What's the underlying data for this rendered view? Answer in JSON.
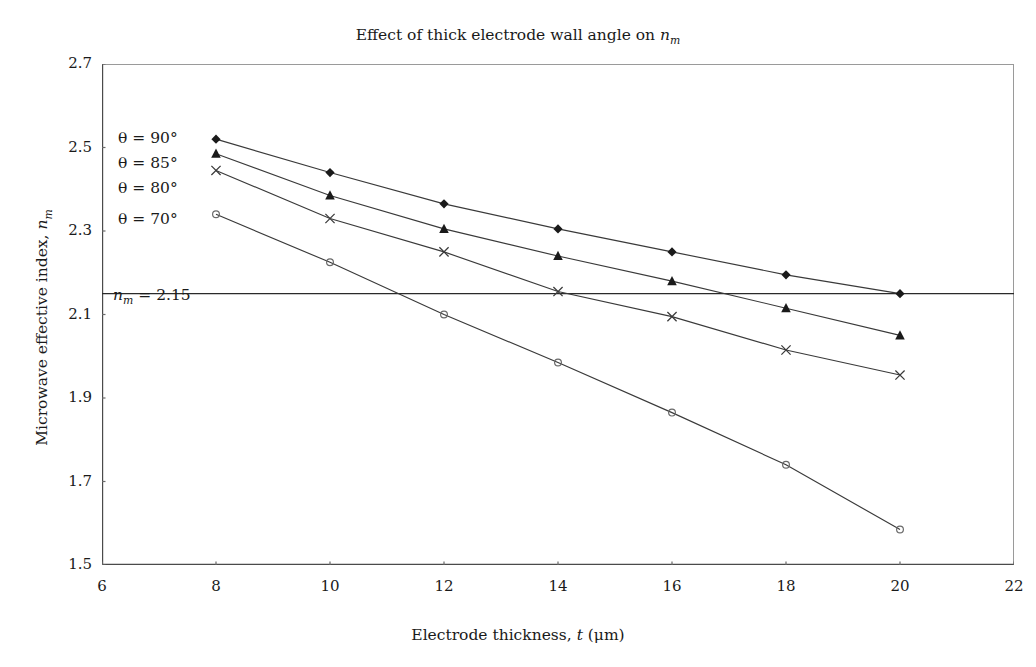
{
  "chart_data": {
    "type": "line",
    "title_main": "Effect of thick electrode wall angle on",
    "title_symbol": "n",
    "title_symbol_sub": "m",
    "xlabel_main": "Electrode thickness,",
    "xlabel_symbol": "t",
    "xlabel_unit": "(μm)",
    "xlabel": "Electrode thickness, t (μm)",
    "ylabel_main": "Microwave effective index,",
    "ylabel_symbol": "n",
    "ylabel_symbol_sub": "m",
    "ylabel": "Microwave effective index, n_m",
    "xlim": [
      6,
      22
    ],
    "ylim": [
      1.5,
      2.7
    ],
    "xticks": [
      6,
      8,
      10,
      12,
      14,
      16,
      18,
      20,
      22
    ],
    "yticks": [
      1.5,
      1.7,
      1.9,
      2.1,
      2.3,
      2.5,
      2.7
    ],
    "xtick_labels": [
      "6",
      "8",
      "10",
      "12",
      "14",
      "16",
      "18",
      "20",
      "22"
    ],
    "ytick_labels": [
      "1.5",
      "1.7",
      "1.9",
      "2.1",
      "2.3",
      "2.5",
      "2.7"
    ],
    "grid": false,
    "legend_position": "inline-left",
    "line_color": "#3a3a3a",
    "marker_color": "#1a1a1a",
    "x": [
      8,
      10,
      12,
      14,
      16,
      18,
      20
    ],
    "series": [
      {
        "name": "θ = 90°",
        "marker": "diamond",
        "values": [
          2.52,
          2.44,
          2.365,
          2.305,
          2.25,
          2.195,
          2.15
        ],
        "label_x": 118,
        "label_y": 129
      },
      {
        "name": "θ = 85°",
        "marker": "triangle",
        "values": [
          2.485,
          2.385,
          2.305,
          2.24,
          2.18,
          2.115,
          2.05
        ],
        "label_x": 118,
        "label_y": 154
      },
      {
        "name": "θ = 80°",
        "marker": "cross",
        "values": [
          2.445,
          2.33,
          2.25,
          2.155,
          2.095,
          2.015,
          1.955
        ],
        "label_x": 118,
        "label_y": 179
      },
      {
        "name": "θ = 70°",
        "marker": "circle",
        "values": [
          2.34,
          2.225,
          2.1,
          1.985,
          1.865,
          1.74,
          1.585
        ],
        "label_x": 118,
        "label_y": 210
      }
    ],
    "reference_line": {
      "value": 2.15,
      "label_main": "n",
      "label_sub": "m",
      "label_eq": "= 2.15",
      "label": "n_m = 2.15",
      "label_x": 113,
      "label_y": 286
    }
  }
}
